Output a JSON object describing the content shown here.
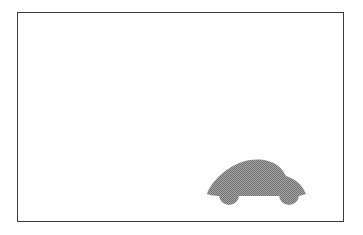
{
  "scene": {
    "frame": {
      "border_color": "#3a3a3a",
      "background": "#ffffff"
    },
    "car": {
      "icon": "car-icon",
      "fill": "#8a8a8a",
      "pattern": "halftone-gray"
    }
  }
}
